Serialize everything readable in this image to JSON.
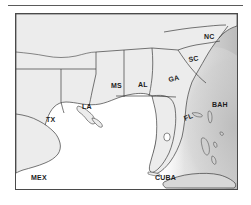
{
  "figure": {
    "type": "map",
    "title": "",
    "frame": {
      "border_color": "#4a4a4a",
      "background": "#ffffff"
    },
    "rule": {
      "color": "#5a5a5a"
    }
  },
  "colors": {
    "land": "#ececec",
    "land_stroke": "#3c3c3c",
    "ocean": "#ffffff",
    "atlantic_shading": "#c8c8c8",
    "label_text": "#1d1d1d",
    "frame_border": "#4a4a4a",
    "rule": "#5a5a5a"
  },
  "map": {
    "state_labels": [
      {
        "code": "TX",
        "name": "Texas",
        "x": 30,
        "y": 108
      },
      {
        "code": "LA",
        "name": "Louisiana",
        "x": 66,
        "y": 95
      },
      {
        "code": "MS",
        "name": "Mississippi",
        "x": 95,
        "y": 74
      },
      {
        "code": "AL",
        "name": "Alabama",
        "x": 122,
        "y": 73
      },
      {
        "code": "GA",
        "name": "Georgia",
        "x": 153,
        "y": 68
      },
      {
        "code": "SC",
        "name": "South Carolina",
        "x": 173,
        "y": 48
      },
      {
        "code": "NC",
        "name": "North Carolina",
        "x": 188,
        "y": 25
      },
      {
        "code": "FL",
        "name": "Florida",
        "x": 169,
        "y": 107
      }
    ],
    "region_labels": [
      {
        "code": "MEX",
        "name": "Mexico",
        "x": 15,
        "y": 166
      },
      {
        "code": "CUBA",
        "name": "Cuba",
        "x": 139,
        "y": 166
      },
      {
        "code": "BAH",
        "name": "Bahamas",
        "x": 205,
        "y": 111
      }
    ],
    "water_bodies": [
      {
        "name": "Gulf of Mexico",
        "shading": "none"
      },
      {
        "name": "Atlantic Ocean",
        "shading": "gradient-gray"
      }
    ]
  }
}
